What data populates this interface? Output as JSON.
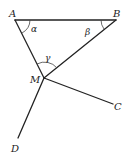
{
  "diagram": {
    "points": {
      "A": {
        "label": "A",
        "x": 15,
        "y": 20
      },
      "B": {
        "label": "B",
        "x": 116,
        "y": 20
      },
      "M": {
        "label": "M",
        "x": 44,
        "y": 78
      },
      "C": {
        "label": "C",
        "x": 113,
        "y": 104
      },
      "D": {
        "label": "D",
        "x": 18,
        "y": 138
      }
    },
    "segments": [
      {
        "from": "A",
        "to": "B"
      },
      {
        "from": "A",
        "to": "M"
      },
      {
        "from": "B",
        "to": "M"
      },
      {
        "from": "M",
        "to": "C"
      },
      {
        "from": "M",
        "to": "D"
      }
    ],
    "angles": {
      "alpha": {
        "label": "α",
        "vertex": "A"
      },
      "beta": {
        "label": "β",
        "vertex": "B"
      },
      "gamma": {
        "label": "γ",
        "vertex": "M"
      }
    },
    "colors": {
      "line": "#222222",
      "background": "#ffffff"
    }
  }
}
